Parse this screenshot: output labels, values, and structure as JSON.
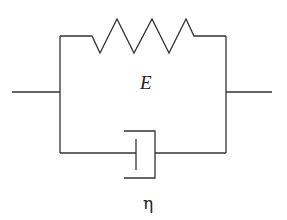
{
  "diagram": {
    "spring": {
      "label": "E"
    },
    "dashpot": {
      "label": "η"
    },
    "colors": {
      "line": "#333333",
      "background": "#ffffff"
    }
  }
}
